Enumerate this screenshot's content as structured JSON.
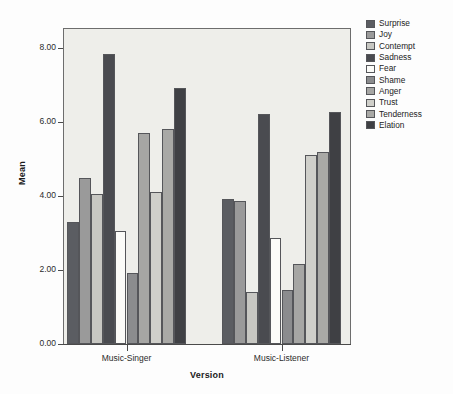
{
  "chart_data": {
    "type": "bar",
    "title": "",
    "subtitle": "",
    "xlabel": "Version",
    "ylabel": "Mean",
    "categories": [
      "Music-Singer",
      "Music-Listener"
    ],
    "ylim": [
      0.0,
      8.5
    ],
    "yticks": [
      0.0,
      2.0,
      4.0,
      6.0,
      8.0
    ],
    "ytick_labels": [
      "0.00",
      "2.00",
      "4.00",
      "6.00",
      "8.00"
    ],
    "grid": false,
    "legend_position": "right",
    "series": [
      {
        "name": "Surprise",
        "color": "#5b5d62",
        "values": [
          3.3,
          3.92
        ]
      },
      {
        "name": "Joy",
        "color": "#9a9a9a",
        "values": [
          4.47,
          3.85
        ]
      },
      {
        "name": "Contempt",
        "color": "#c7c7c2",
        "values": [
          4.04,
          1.4
        ]
      },
      {
        "name": "Sadness",
        "color": "#4a4b50",
        "values": [
          7.82,
          6.2
        ]
      },
      {
        "name": "Fear",
        "color": "#fbfbf8",
        "values": [
          3.05,
          2.85
        ]
      },
      {
        "name": "Shame",
        "color": "#8b8c8e",
        "values": [
          1.92,
          1.47
        ]
      },
      {
        "name": "Anger",
        "color": "#a6a6a4",
        "values": [
          5.7,
          2.15
        ]
      },
      {
        "name": "Trust",
        "color": "#cfcfca",
        "values": [
          4.1,
          5.1
        ]
      },
      {
        "name": "Tenderness",
        "color": "#a9a9a6",
        "values": [
          5.8,
          5.17
        ]
      },
      {
        "name": "Elation",
        "color": "#3f4044",
        "values": [
          6.92,
          6.27
        ]
      }
    ]
  },
  "axes": {
    "y_title": "Mean",
    "x_title": "Version"
  },
  "legend": {
    "entries": [
      "Surprise",
      "Joy",
      "Contempt",
      "Sadness",
      "Fear",
      "Shame",
      "Anger",
      "Trust",
      "Tenderness",
      "Elation"
    ]
  },
  "colors": {
    "plot_background": "#eeeeea",
    "figure_background": "#fdfdfd",
    "axis_line": "#4a4a4a",
    "bar_outline": "#55565a",
    "text": "#232323"
  }
}
